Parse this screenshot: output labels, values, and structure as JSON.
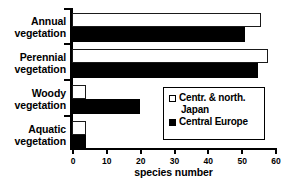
{
  "chart_data": {
    "type": "bar",
    "orientation": "horizontal",
    "title": "",
    "xlabel": "species number",
    "ylabel": "",
    "xlim": [
      0,
      60
    ],
    "xticks": [
      0,
      10,
      20,
      30,
      40,
      50,
      60
    ],
    "grid": false,
    "legend_position": "center-right",
    "categories": [
      "Annual vegetation",
      "Perennial vegetation",
      "Woody vegetation",
      "Aquatic vegetation"
    ],
    "series": [
      {
        "name": "Centr. & north. Japan",
        "color": "#ffffff",
        "edge_color": "#000000",
        "values": [
          56,
          58,
          4,
          4
        ]
      },
      {
        "name": "Central Europe",
        "color": "#000000",
        "edge_color": "#000000",
        "values": [
          51,
          55,
          20,
          4
        ]
      }
    ]
  },
  "categories_display": [
    {
      "line1": "Annual",
      "line2": "vegetation"
    },
    {
      "line1": "Perennial",
      "line2": "vegetation"
    },
    {
      "line1": "Woody",
      "line2": "vegetation"
    },
    {
      "line1": "Aquatic",
      "line2": "vegetation"
    }
  ],
  "axis": {
    "x_title": "species number",
    "tick_labels": [
      "0",
      "10",
      "20",
      "30",
      "40",
      "50",
      "60"
    ]
  },
  "legend": {
    "entries": [
      {
        "label_line1": "Centr. & north.",
        "label_line2": "Japan",
        "swatch": "open-square"
      },
      {
        "label_line1": "Central Europe",
        "label_line2": "",
        "swatch": "filled-square"
      }
    ]
  }
}
